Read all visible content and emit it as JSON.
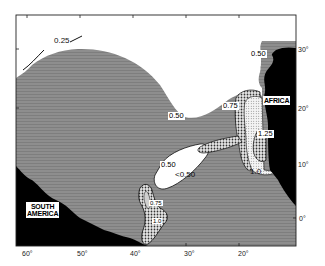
{
  "map": {
    "regions": {
      "south_america": "SOUTH AMERICA",
      "south_america_line1": "SOUTH",
      "south_america_line2": "AMERICA",
      "africa": "AFRICA"
    },
    "contour_labels": {
      "c025": "0.25",
      "c050_north": "0.50",
      "c050_center": "0.50",
      "c050_west": "0.50",
      "lt050": "<0.50",
      "c075_africa": "0.75",
      "c125": "1.25",
      "c10": "1.0",
      "c075_sw": "0.75",
      "c10_sw": "1.0"
    },
    "x_axis_labels": [
      "60°",
      "50°",
      "40°",
      "30°",
      "20°"
    ],
    "y_axis_labels": [
      "30°",
      "20°",
      "10°",
      "0°"
    ],
    "legend_shading": {
      "white": "< 0.50",
      "gray": "0.50 – 0.75",
      "coarse_dots": "0.75 – 1.0",
      "fine_dots": "> 1.0",
      "black": "land"
    },
    "colors": {
      "land": "#000000",
      "ocean_mid": "#8a8a8a",
      "ocean_low": "#ffffff",
      "frame": "#222222"
    }
  }
}
